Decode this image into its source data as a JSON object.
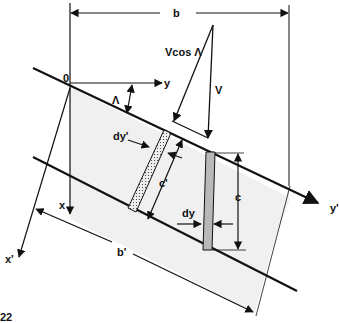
{
  "figure": {
    "colors": {
      "line": "#111111",
      "wing_fill": "#f0f0f0",
      "strip_fill": "#b8b8b8",
      "dotted_strip_fill": "#e8e8e8"
    },
    "labels": {
      "origin": "0",
      "y_axis": "y",
      "x_axis": "x",
      "y_prime_axis": "y'",
      "x_prime_axis": "x'",
      "sweep_angle": "Λ",
      "span": "b",
      "swept_span": "b'",
      "velocity": "V",
      "normal_velocity": "Vcos Λ",
      "chord": "c",
      "normal_chord": "c'",
      "strip_width": "dy",
      "normal_strip_width": "dy'"
    },
    "page_number": "22"
  }
}
